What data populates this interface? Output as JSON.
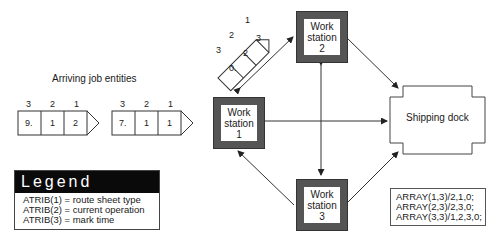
{
  "arriving": {
    "title": "Arriving job entities",
    "entities": [
      {
        "headers": [
          "3",
          "2",
          "1"
        ],
        "cells": [
          "9.",
          "1",
          "2"
        ]
      },
      {
        "headers": [
          "3",
          "2",
          "1"
        ],
        "cells": [
          "7.",
          "1",
          "1"
        ]
      }
    ]
  },
  "in_transit_entity": {
    "headers": [
      "3",
      "2",
      "1"
    ],
    "cells": [
      "0.",
      "2",
      "3"
    ]
  },
  "workstations": [
    {
      "line1": "Work",
      "line2": "station",
      "line3": "1"
    },
    {
      "line1": "Work",
      "line2": "station",
      "line3": "2"
    },
    {
      "line1": "Work",
      "line2": "station",
      "line3": "3"
    }
  ],
  "shipping_dock": {
    "label": "Shipping dock"
  },
  "legend": {
    "title": "Legend",
    "items": [
      "ATRIB(1) = route sheet type",
      "ATRIB(2) = current operation",
      "ATRIB(3) = mark time"
    ]
  },
  "arrays": [
    "ARRAY(1,3)/2,1,0;",
    "ARRAY(2,3)/2,3,0;",
    "ARRAY(3,3)/1,2,3,0;"
  ],
  "colors": {
    "station_border": "#555555",
    "legend_header_bg": "#0a0a0a",
    "line": "#333333"
  }
}
